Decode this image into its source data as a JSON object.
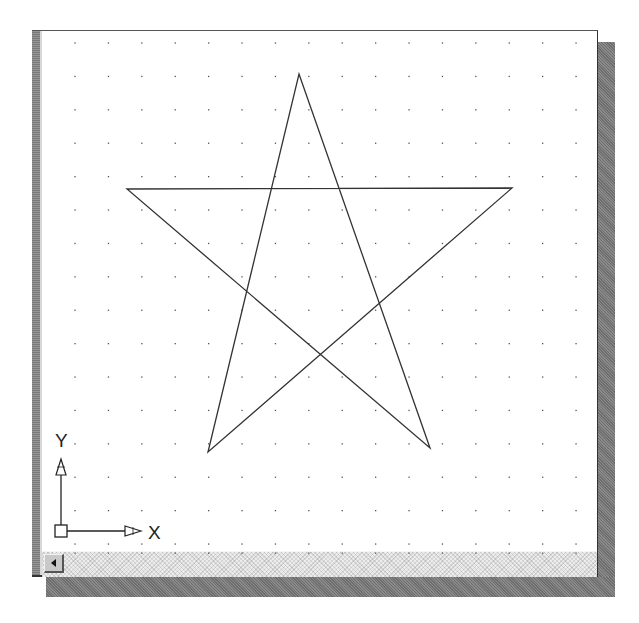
{
  "window": {
    "type": "CAD drawing viewport"
  },
  "viewport": {
    "background": "#ffffff",
    "grid": {
      "visible": true,
      "dot_color": "#555555",
      "spacing_px": 33.4,
      "origin_px": [
        33,
        12
      ]
    },
    "drawing": {
      "entity": "star",
      "line_color": "#333333",
      "vertices_px": [
        [
          257,
          43
        ],
        [
          388,
          417
        ],
        [
          85,
          158
        ],
        [
          470,
          157
        ],
        [
          166,
          421
        ]
      ]
    },
    "ucs_icon": {
      "x_label": "X",
      "y_label": "Y"
    }
  },
  "scrollbar": {
    "orientation": "horizontal",
    "left_button_icon": "arrow-left-icon"
  },
  "colors": {
    "frame_border": "#333333",
    "shadow": "#7a7a7a",
    "scroll_track": "#ececec",
    "scroll_button": "#c8c8c8"
  }
}
